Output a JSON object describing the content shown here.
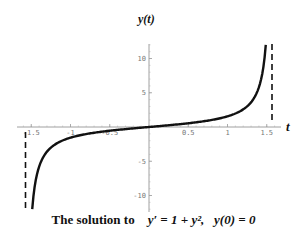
{
  "chart_data": {
    "type": "line",
    "title": "y(t)",
    "xlabel": "t",
    "ylabel": "y(t)",
    "caption": "The solution to  y' = 1 + y², y(0) = 0",
    "function": "y = tan(t)",
    "xlim": [
      -1.6,
      1.65
    ],
    "ylim": [
      -12,
      12
    ],
    "x_ticks": [
      -1.5,
      -1,
      -0.5,
      0.5,
      1,
      1.5
    ],
    "x_tick_labels": [
      "-1.5",
      "-1",
      "-0.5",
      "0.5",
      "1",
      "1.5"
    ],
    "y_ticks": [
      -10,
      -5,
      5,
      10
    ],
    "y_tick_labels": [
      "-10",
      "-5",
      "5",
      "10"
    ],
    "asymptotes": [
      -1.5708,
      1.5708
    ],
    "grid": false,
    "series": [
      {
        "name": "y(t)",
        "x": [
          -1.487,
          -1.4,
          -1.3,
          -1.2,
          -1.0,
          -0.8,
          -0.5,
          -0.25,
          0,
          0.25,
          0.5,
          0.8,
          1.0,
          1.2,
          1.3,
          1.4,
          1.487
        ],
        "values": [
          -12,
          -5.8,
          -3.6,
          -2.57,
          -1.56,
          -1.03,
          -0.55,
          -0.26,
          0,
          0.26,
          0.55,
          1.03,
          1.56,
          2.57,
          3.6,
          5.8,
          12
        ]
      }
    ]
  },
  "labels": {
    "title": "y(t)",
    "t_axis": "t",
    "caption_text": "The solution to",
    "caption_eq1": "y′ = 1 + y²,",
    "caption_eq2": "y(0) = 0"
  }
}
